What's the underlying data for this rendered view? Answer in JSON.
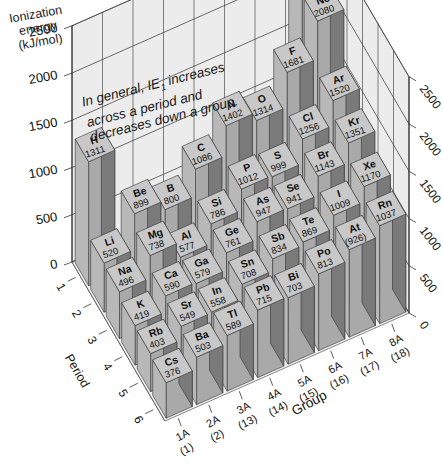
{
  "chart_data": {
    "type": "bar3d",
    "title": "",
    "zlabel": "Ionization energy (kJ/mol)",
    "xlabel": "Group",
    "ylabel": "Period",
    "annotation": "In general, IE1 increases across a period and decreases down a group.",
    "z_ticks": [
      0,
      500,
      1000,
      1500,
      2000,
      2500
    ],
    "z_range": [
      0,
      2500
    ],
    "groups": [
      {
        "label": "1A",
        "sub": "(1)"
      },
      {
        "label": "2A",
        "sub": "(2)"
      },
      {
        "label": "3A",
        "sub": "(13)"
      },
      {
        "label": "4A",
        "sub": "(14)"
      },
      {
        "label": "5A",
        "sub": "(15)"
      },
      {
        "label": "6A",
        "sub": "(16)"
      },
      {
        "label": "7A",
        "sub": "(17)"
      },
      {
        "label": "8A",
        "sub": "(18)"
      }
    ],
    "periods": [
      "1",
      "2",
      "3",
      "4",
      "5",
      "6"
    ],
    "elements": [
      {
        "symbol": "H",
        "value": "1311",
        "group": 0,
        "period": 0,
        "z": 1311
      },
      {
        "symbol": "He",
        "value": "2372",
        "group": 7,
        "period": 0,
        "z": 2372
      },
      {
        "symbol": "Li",
        "value": "520",
        "group": 0,
        "period": 1,
        "z": 520
      },
      {
        "symbol": "Be",
        "value": "899",
        "group": 1,
        "period": 1,
        "z": 899
      },
      {
        "symbol": "B",
        "value": "800",
        "group": 2,
        "period": 1,
        "z": 800
      },
      {
        "symbol": "C",
        "value": "1086",
        "group": 3,
        "period": 1,
        "z": 1086
      },
      {
        "symbol": "N",
        "value": "1402",
        "group": 4,
        "period": 1,
        "z": 1402
      },
      {
        "symbol": "O",
        "value": "1314",
        "group": 5,
        "period": 1,
        "z": 1314
      },
      {
        "symbol": "F",
        "value": "1681",
        "group": 6,
        "period": 1,
        "z": 1681
      },
      {
        "symbol": "Ne",
        "value": "2080",
        "group": 7,
        "period": 1,
        "z": 2080
      },
      {
        "symbol": "Na",
        "value": "496",
        "group": 0,
        "period": 2,
        "z": 496
      },
      {
        "symbol": "Mg",
        "value": "738",
        "group": 1,
        "period": 2,
        "z": 738
      },
      {
        "symbol": "Al",
        "value": "577",
        "group": 2,
        "period": 2,
        "z": 577
      },
      {
        "symbol": "Si",
        "value": "786",
        "group": 3,
        "period": 2,
        "z": 786
      },
      {
        "symbol": "P",
        "value": "1012",
        "group": 4,
        "period": 2,
        "z": 1012
      },
      {
        "symbol": "S",
        "value": "999",
        "group": 5,
        "period": 2,
        "z": 999
      },
      {
        "symbol": "Cl",
        "value": "1256",
        "group": 6,
        "period": 2,
        "z": 1256
      },
      {
        "symbol": "Ar",
        "value": "1520",
        "group": 7,
        "period": 2,
        "z": 1520
      },
      {
        "symbol": "K",
        "value": "419",
        "group": 0,
        "period": 3,
        "z": 419
      },
      {
        "symbol": "Ca",
        "value": "590",
        "group": 1,
        "period": 3,
        "z": 590
      },
      {
        "symbol": "Ga",
        "value": "579",
        "group": 2,
        "period": 3,
        "z": 579
      },
      {
        "symbol": "Ge",
        "value": "761",
        "group": 3,
        "period": 3,
        "z": 761
      },
      {
        "symbol": "As",
        "value": "947",
        "group": 4,
        "period": 3,
        "z": 947
      },
      {
        "symbol": "Se",
        "value": "941",
        "group": 5,
        "period": 3,
        "z": 941
      },
      {
        "symbol": "Br",
        "value": "1143",
        "group": 6,
        "period": 3,
        "z": 1143
      },
      {
        "symbol": "Kr",
        "value": "1351",
        "group": 7,
        "period": 3,
        "z": 1351
      },
      {
        "symbol": "Rb",
        "value": "403",
        "group": 0,
        "period": 4,
        "z": 403
      },
      {
        "symbol": "Sr",
        "value": "549",
        "group": 1,
        "period": 4,
        "z": 549
      },
      {
        "symbol": "In",
        "value": "558",
        "group": 2,
        "period": 4,
        "z": 558
      },
      {
        "symbol": "Sn",
        "value": "708",
        "group": 3,
        "period": 4,
        "z": 708
      },
      {
        "symbol": "Sb",
        "value": "834",
        "group": 4,
        "period": 4,
        "z": 834
      },
      {
        "symbol": "Te",
        "value": "869",
        "group": 5,
        "period": 4,
        "z": 869
      },
      {
        "symbol": "I",
        "value": "1009",
        "group": 6,
        "period": 4,
        "z": 1009
      },
      {
        "symbol": "Xe",
        "value": "1170",
        "group": 7,
        "period": 4,
        "z": 1170
      },
      {
        "symbol": "Cs",
        "value": "376",
        "group": 0,
        "period": 5,
        "z": 376
      },
      {
        "symbol": "Ba",
        "value": "503",
        "group": 1,
        "period": 5,
        "z": 503
      },
      {
        "symbol": "Tl",
        "value": "589",
        "group": 2,
        "period": 5,
        "z": 589
      },
      {
        "symbol": "Pb",
        "value": "715",
        "group": 3,
        "period": 5,
        "z": 715
      },
      {
        "symbol": "Bi",
        "value": "703",
        "group": 4,
        "period": 5,
        "z": 703
      },
      {
        "symbol": "Po",
        "value": "813",
        "group": 5,
        "period": 5,
        "z": 813
      },
      {
        "symbol": "At",
        "value": "(926)",
        "group": 6,
        "period": 5,
        "z": 926
      },
      {
        "symbol": "Rn",
        "value": "1037",
        "group": 7,
        "period": 5,
        "z": 1037
      }
    ],
    "colors": {
      "top": "#c8c8c8",
      "left": "#a9a9a9",
      "right": "#7a7a7a",
      "wall": "#ececec",
      "grid": "#333333"
    }
  },
  "labels": {
    "zlabel_lines": [
      "Ionization",
      "energy",
      "(kJ/mol)"
    ],
    "note_line1_a": "In general, ",
    "note_line1_ie": "IE",
    "note_line1_sub": "1",
    "note_line1_b": " increases",
    "note_line2": "across a period and",
    "note_line3": "decreases down a group.",
    "period_axis": "Period",
    "group_axis": "Group"
  }
}
